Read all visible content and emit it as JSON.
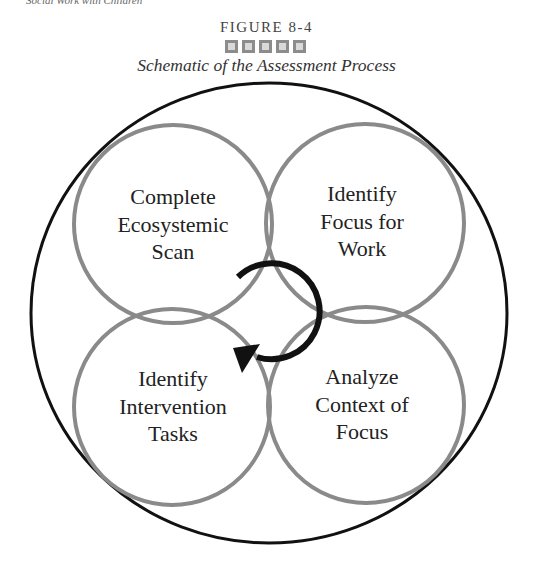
{
  "running_head": "Social Work with Children",
  "figure": {
    "label": "FIGURE 8-4",
    "ornament_squares": 5,
    "title": "Schematic of the Assessment Process"
  },
  "colors": {
    "outer_circle": "#111111",
    "inner_circles": "#8a8a8a",
    "arrow": "#111111",
    "text": "#222222",
    "ornament": "#8c8c8c"
  },
  "diagram": {
    "outer_circle": {
      "cx": 269,
      "cy": 313,
      "rx": 238,
      "ry": 230
    },
    "nodes": [
      {
        "id": "tl",
        "lines": [
          "Complete",
          "Ecosystemic",
          "Scan"
        ],
        "cx": 173,
        "cy": 224,
        "r": 99
      },
      {
        "id": "tr",
        "lines": [
          "Identify",
          "Focus for",
          "Work"
        ],
        "cx": 365,
        "cy": 223,
        "r": 99
      },
      {
        "id": "bl",
        "lines": [
          "Identify",
          "Intervention",
          "Tasks"
        ],
        "cx": 172,
        "cy": 407,
        "r": 98
      },
      {
        "id": "br",
        "lines": [
          "Analyze",
          "Context of",
          "Focus"
        ],
        "cx": 366,
        "cy": 405,
        "r": 98
      }
    ],
    "cycle_arrow": {
      "direction": "clockwise",
      "cx": 270,
      "cy": 312,
      "r": 48
    }
  }
}
